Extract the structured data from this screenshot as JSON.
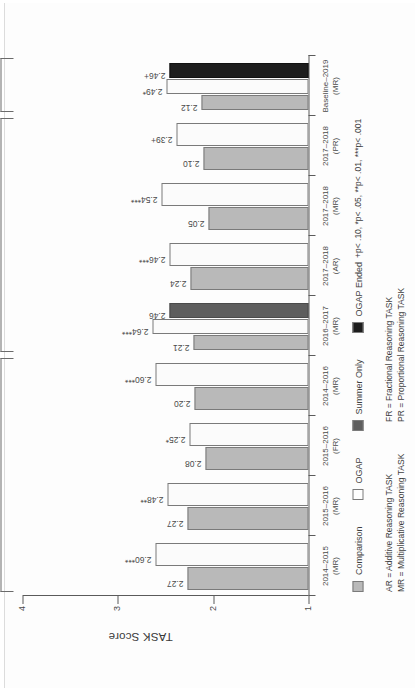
{
  "figure": {
    "orientation_note": "rotated-90-ccw-scan"
  },
  "chart_data": {
    "type": "bar",
    "title": "",
    "xlabel": "",
    "ylabel": "TASK Score",
    "ylim": [
      1,
      4
    ],
    "yticks": [
      "1",
      "2",
      "3",
      "4"
    ],
    "grid": false,
    "legend_position": "below-axis",
    "categories": [
      "2014–2015\n(MR)",
      "2015–2016\n(MR)",
      "2015–2016\n(FR)",
      "2014–2016\n(MR)",
      "2016–2017\n(MR)",
      "2017–2018\n(AR)",
      "2017–2018\n(MR)",
      "2017–2018\n(PR)",
      "Baseline–2019\n(MR)"
    ],
    "category_lines": [
      [
        "2014–2015",
        "(MR)"
      ],
      [
        "2015–2016",
        "(MR)"
      ],
      [
        "2015–2016",
        "(FR)"
      ],
      [
        "2014–2016",
        "(MR)"
      ],
      [
        "2016–2017",
        "(MR)"
      ],
      [
        "2017–2018",
        "(AR)"
      ],
      [
        "2017–2018",
        "(MR)"
      ],
      [
        "2017–2018",
        "(PR)"
      ],
      [
        "Baseline–2019",
        "(MR)"
      ]
    ],
    "series": [
      {
        "name": "Comparison",
        "color": "#b9b9b9",
        "values": [
          2.27,
          2.27,
          2.08,
          2.2,
          2.21,
          2.24,
          2.05,
          2.1,
          2.12
        ],
        "labels": [
          "2.27",
          "2.27",
          "2.08",
          "2.20",
          "2.21",
          "2.24",
          "2.05",
          "2.10",
          "2.12"
        ]
      },
      {
        "name": "OGAP",
        "color": "#fbfbfb",
        "values": [
          2.6,
          2.48,
          2.25,
          2.6,
          2.64,
          2.46,
          2.54,
          2.39,
          2.49
        ],
        "labels": [
          "2.60***",
          "2.48**",
          "2.25*",
          "2.60***",
          "2.64***",
          "2.46***",
          "2.54***",
          "2.39+",
          "2.49*"
        ]
      },
      {
        "name": "Summer Only",
        "color": "#5e5e5e",
        "values": [
          null,
          null,
          null,
          null,
          2.46,
          null,
          null,
          null,
          null
        ],
        "labels": [
          "",
          "",
          "",
          "",
          "2.46",
          "",
          "",
          "",
          ""
        ]
      },
      {
        "name": "OGAP Ended",
        "color": "#1d1d1d",
        "values": [
          null,
          null,
          null,
          null,
          null,
          null,
          null,
          null,
          2.46
        ],
        "labels": [
          "",
          "",
          "",
          "",
          "",
          "",
          "",
          "",
          "2.46+"
        ]
      }
    ]
  },
  "brackets": [
    {
      "label": "Experimental Study Impacts",
      "start": 0,
      "end": 3
    },
    {
      "label": "Quasi-experimental Study Impacts",
      "start": 4,
      "end": 7
    },
    {
      "label": "Persistence\nStudy Impacts",
      "label_line1": "Persistence",
      "label_line2": "Study Impacts",
      "start": 8,
      "end": 8
    }
  ],
  "legend": {
    "items": [
      {
        "label": "Comparison",
        "swatch": "comparison"
      },
      {
        "label": "OGAP",
        "swatch": "ogap"
      },
      {
        "label": "Summer Only",
        "swatch": "summer"
      },
      {
        "label": "OGAP Ended",
        "swatch": "ended"
      }
    ]
  },
  "notes": {
    "abbrev_left_1": "AR = Additive Reasoning TASK",
    "abbrev_left_2": "MR = Multiplicative Reasoning TASK",
    "abbrev_right_1": "FR = Fractional Reasoning TASK",
    "abbrev_right_2": "PR = Proportional Reasoning TASK",
    "significance": "+p< .10, *p< .05, **p< .01, ***p< .001"
  }
}
